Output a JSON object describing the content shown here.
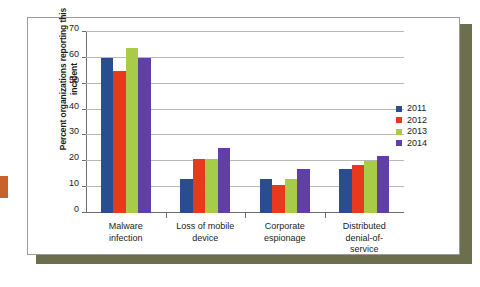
{
  "figure": {
    "card_background": "#ffffff",
    "card_border": "#9a9a96",
    "shadow_color": "#6b6f4e",
    "edge_tab_color": "#c9622a"
  },
  "chart_data": {
    "type": "bar",
    "title": "",
    "xlabel": "",
    "ylabel": "Percent organizations reporting this incident",
    "ylim": [
      0,
      70
    ],
    "yticks": [
      0,
      10,
      20,
      30,
      40,
      50,
      60,
      70
    ],
    "ytick_labels": [
      "0",
      "10",
      "20",
      "30",
      "40",
      "50",
      "60",
      "70"
    ],
    "grid": true,
    "legend_position": "right",
    "categories": [
      "Malware\ninfection",
      "Loss of mobile\ndevice",
      "Corporate\nespionage",
      "Distributed\ndenial-of-service"
    ],
    "series": [
      {
        "name": "2011",
        "color": "#2a4d8f",
        "values": [
          60,
          13,
          13,
          17
        ]
      },
      {
        "name": "2012",
        "color": "#e8391e",
        "values": [
          55,
          21,
          11,
          18.5
        ]
      },
      {
        "name": "2013",
        "color": "#a8cc47",
        "values": [
          64,
          21,
          13,
          20
        ]
      },
      {
        "name": "2014",
        "color": "#6040a8",
        "values": [
          60,
          25,
          17,
          22
        ]
      }
    ]
  },
  "legend": {
    "entries": [
      {
        "label": "2011",
        "color": "#2a4d8f"
      },
      {
        "label": "2012",
        "color": "#e8391e"
      },
      {
        "label": "2013",
        "color": "#a8cc47"
      },
      {
        "label": "2014",
        "color": "#6040a8"
      }
    ]
  }
}
